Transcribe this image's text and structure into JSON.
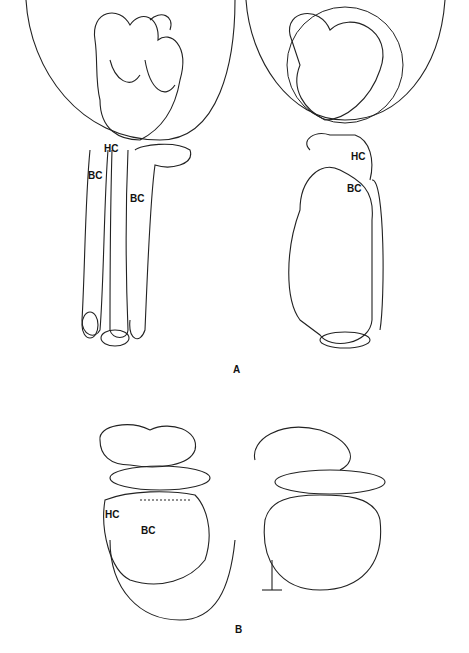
{
  "figure": {
    "panels": [
      {
        "id": "A",
        "label": "A",
        "views": [
          {
            "side": "left",
            "labels": [
              "HC",
              "BC",
              "BC"
            ]
          },
          {
            "side": "right",
            "labels": [
              "HC",
              "BC"
            ],
            "signature": "signature"
          }
        ]
      },
      {
        "id": "B",
        "label": "B",
        "views": [
          {
            "side": "left",
            "labels": [
              "HC",
              "BC"
            ],
            "signature": "signature"
          },
          {
            "side": "right",
            "labels": []
          }
        ]
      }
    ]
  },
  "labels": {
    "a_left_hc": "HC",
    "a_left_bc1": "BC",
    "a_left_bc2": "BC",
    "a_right_hc": "HC",
    "a_right_bc": "BC",
    "panel_a": "A",
    "b_left_hc": "HC",
    "b_left_bc": "BC",
    "panel_b": "B"
  },
  "colors": {
    "ink": "#111111",
    "background": "#ffffff"
  }
}
